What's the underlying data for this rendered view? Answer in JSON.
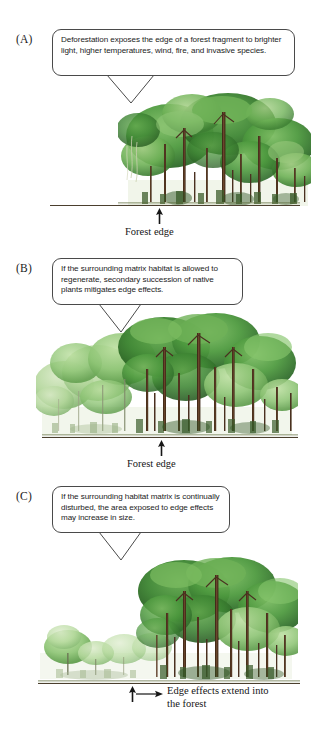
{
  "figure": {
    "type": "diagram",
    "panels": [
      {
        "id": "A",
        "label": "(A)",
        "callout": "Deforestation exposes the edge of a forest fragment to brighter light, higher temperatures, wind, fire, and invasive species.",
        "edge_caption": "Forest edge"
      },
      {
        "id": "B",
        "label": "(B)",
        "callout": "If the surrounding matrix habitat is allowed to regenerate, secondary succession of native plants mitigates edge effects.",
        "edge_caption": "Forest edge"
      },
      {
        "id": "C",
        "label": "(C)",
        "callout": "If the surrounding habitat matrix is continually disturbed, the area exposed to edge effects may increase in size.",
        "edge_caption_line1": "Edge effects extend into",
        "edge_caption_line2": "the forest"
      }
    ]
  },
  "colors": {
    "canopy_dark": "#2f6b2a",
    "canopy_mid": "#4e9a3f",
    "canopy_light": "#8dc474",
    "canopy_pale": "#bcd8a4",
    "trunk": "#5a3a24",
    "trunk_dark": "#3c2717",
    "ground": "#4b3f2e",
    "bubble_border": "#4a4a4a",
    "text": "#1b1b1b"
  },
  "icons": {
    "up_arrow": "up-arrow-icon",
    "right_arrow": "right-arrow-icon",
    "bubble_tail": "callout-tail-icon"
  }
}
